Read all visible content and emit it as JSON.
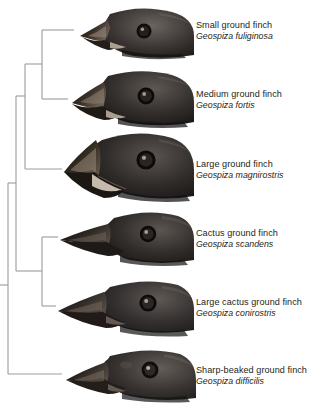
{
  "figure": {
    "type": "cladogram",
    "background_color": "#ffffff",
    "branch_color": "#9b9b9b",
    "text_color": "#231f20"
  },
  "species": [
    {
      "common_name": "Small ground finch",
      "scientific_name": "Geospiza fuliginosa",
      "photo_alt": "small-ground-finch-head",
      "beak": "small stubby conical beak",
      "tip_y": 30
    },
    {
      "common_name": "Medium ground finch",
      "scientific_name": "Geospiza fortis",
      "photo_alt": "medium-ground-finch-head",
      "beak": "medium deep conical beak",
      "tip_y": 99
    },
    {
      "common_name": "Large ground finch",
      "scientific_name": "Geospiza magnirostris",
      "photo_alt": "large-ground-finch-head",
      "beak": "very large massive conical beak",
      "tip_y": 169
    },
    {
      "common_name": "Cactus ground finch",
      "scientific_name": "Geospiza scandens",
      "photo_alt": "cactus-ground-finch-head",
      "beak": "long pointed slender beak",
      "tip_y": 237
    },
    {
      "common_name": "Large cactus ground finch",
      "scientific_name": "Geospiza conirostris",
      "photo_alt": "large-cactus-ground-finch-head",
      "beak": "long heavy pointed beak",
      "tip_y": 306
    },
    {
      "common_name": "Sharp-beaked ground finch",
      "scientific_name": "Geospiza difficilis",
      "photo_alt": "sharp-beaked-ground-finch-head",
      "beak": "sharp slender pointed beak",
      "tip_y": 374
    }
  ],
  "tree": {
    "root_x": 8,
    "root_y": 285,
    "nodes": [
      {
        "name": "node-fuliginosa-fortis",
        "x": 42,
        "children_y": [
          30,
          99
        ]
      },
      {
        "name": "node-ground-finches",
        "x": 25,
        "children_y": [
          64,
          169
        ]
      },
      {
        "name": "node-scandens-conirostris",
        "x": 42,
        "children_y": [
          237,
          306
        ]
      },
      {
        "name": "node-upper-clade",
        "x": 16,
        "children_y": [
          96,
          271
        ]
      },
      {
        "name": "node-root",
        "x": 8,
        "children_y": [
          183,
          374
        ]
      }
    ],
    "tip_x": 60
  }
}
